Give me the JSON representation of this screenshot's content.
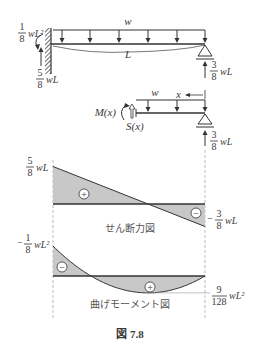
{
  "figure": {
    "caption": "図 7.8",
    "beam": {
      "load_label": "w",
      "span_label": "L",
      "left_support": "fixed",
      "right_support": "roller",
      "fixed_moment": {
        "num": "1",
        "den": "8",
        "expr": "wL²"
      },
      "left_reaction": {
        "num": "5",
        "den": "8",
        "expr": "wL"
      },
      "right_reaction": {
        "num": "3",
        "den": "8",
        "expr": "wL"
      }
    },
    "free_body": {
      "load_label": "w",
      "x_label": "x",
      "moment_label": "M(x)",
      "shear_label": "S(x)",
      "reaction": {
        "num": "3",
        "den": "8",
        "expr": "wL"
      }
    },
    "shear_diagram": {
      "title": "せん断力図",
      "left_value": {
        "sign": "",
        "num": "5",
        "den": "8",
        "expr": "wL"
      },
      "right_value": {
        "sign": "−",
        "num": "3",
        "den": "8",
        "expr": "wL"
      },
      "positive_sign": "+",
      "negative_sign": "−"
    },
    "moment_diagram": {
      "title": "曲げモーメント図",
      "left_value": {
        "sign": "−",
        "num": "1",
        "den": "8",
        "expr": "wL²"
      },
      "max_value": {
        "sign": "",
        "num": "9",
        "den": "128",
        "expr": "wL²"
      },
      "positive_sign": "+",
      "negative_sign": "−"
    },
    "colors": {
      "line": "#333333",
      "fill": "#c8c8c8",
      "dashed": "#aaaaaa"
    }
  },
  "chart_data": [
    {
      "type": "area",
      "title": "せん断力図",
      "x": [
        0,
        0.625,
        1
      ],
      "x_unit": "L",
      "values": [
        0.625,
        0,
        -0.375
      ],
      "value_unit": "wL",
      "labels": [
        "5/8 wL",
        "−3/8 wL"
      ]
    },
    {
      "type": "area",
      "title": "曲げモーメント図",
      "x": [
        0,
        0.125,
        0.25,
        0.375,
        0.5,
        0.625,
        0.75,
        0.875,
        1
      ],
      "x_unit": "L",
      "values": [
        -0.125,
        -0.0547,
        0,
        0.0391,
        0.0625,
        0.0703,
        0.0625,
        0.0391,
        0
      ],
      "value_unit": "wL²",
      "labels": [
        "−1/8 wL²",
        "9/128 wL²"
      ]
    }
  ]
}
